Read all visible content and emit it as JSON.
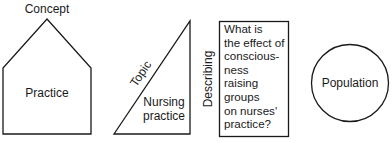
{
  "diagram": {
    "shapes": [
      {
        "id": "concept",
        "shape": "pentagon",
        "top_label": "Concept",
        "inner_label": "Practice"
      },
      {
        "id": "topic",
        "shape": "right-triangle",
        "edge_label": "Topic",
        "inner_lines": [
          "Nursing",
          "practice"
        ]
      },
      {
        "id": "describing",
        "shape": "rectangle",
        "side_label": "Describing",
        "inner_lines": [
          "What is",
          "the effect of",
          "conscious-",
          "ness",
          "raising",
          "groups",
          "on nurses'",
          "practice?"
        ]
      },
      {
        "id": "population",
        "shape": "circle",
        "inner_label": "Population"
      }
    ],
    "colors": {
      "stroke": "#1a1a1a",
      "background": "#ffffff"
    }
  }
}
